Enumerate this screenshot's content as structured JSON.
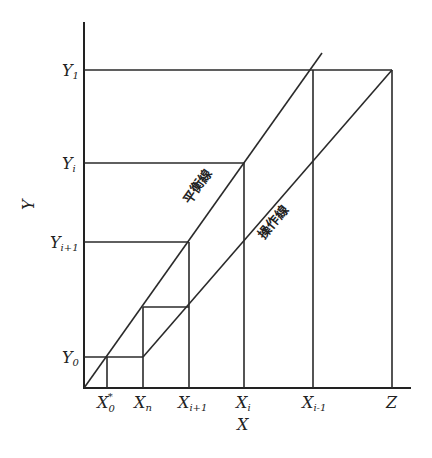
{
  "diagram": {
    "type": "mccabe-thiele-style staircase diagram",
    "axes": {
      "x_label": "X",
      "y_label": "Y"
    },
    "y_ticks": [
      {
        "base": "Y",
        "sub": "1"
      },
      {
        "base": "Y",
        "sub": "i"
      },
      {
        "base": "Y",
        "sub": "i+1"
      },
      {
        "base": "Y",
        "sub": "0"
      }
    ],
    "x_ticks": [
      {
        "base": "X",
        "sub": "0",
        "sup": "*"
      },
      {
        "base": "X",
        "sub": "n"
      },
      {
        "base": "X",
        "sub": "i+1"
      },
      {
        "base": "X",
        "sub": "i"
      },
      {
        "base": "X",
        "sub": "i-1"
      },
      {
        "base": "Z",
        "sub": ""
      }
    ],
    "lines": {
      "equilibrium_label": "平衡線",
      "operating_label": "操作線"
    }
  }
}
